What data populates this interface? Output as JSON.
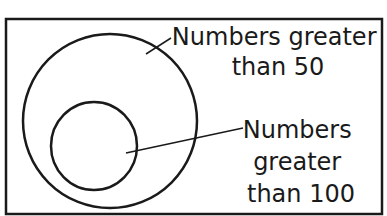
{
  "diagram": {
    "type": "venn-nested-sets",
    "outer_set": {
      "label_lines": [
        "Numbers greater",
        "than 50"
      ]
    },
    "inner_set": {
      "label_lines": [
        "Numbers",
        "greater",
        "than 100"
      ]
    },
    "colors": {
      "stroke": "#1a1a1a",
      "background": "#ffffff"
    }
  }
}
